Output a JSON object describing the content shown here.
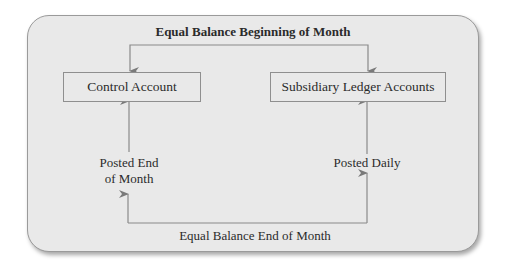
{
  "diagram": {
    "title_top": "Equal Balance Beginning of Month",
    "title_bottom": "Equal Balance End of Month",
    "nodes": [
      {
        "id": "control",
        "label": "Control Account"
      },
      {
        "id": "subsidiary",
        "label": "Subsidiary Ledger Accounts"
      }
    ],
    "edge_labels": {
      "left": "Posted End of Month",
      "left_line1": "Posted End",
      "left_line2": "of Month",
      "right": "Posted Daily"
    },
    "colors": {
      "panel_bg": "#e9e9e9",
      "border": "#8f8f8f",
      "arrow": "#7a7a7a",
      "text": "#2b2b2b"
    }
  }
}
